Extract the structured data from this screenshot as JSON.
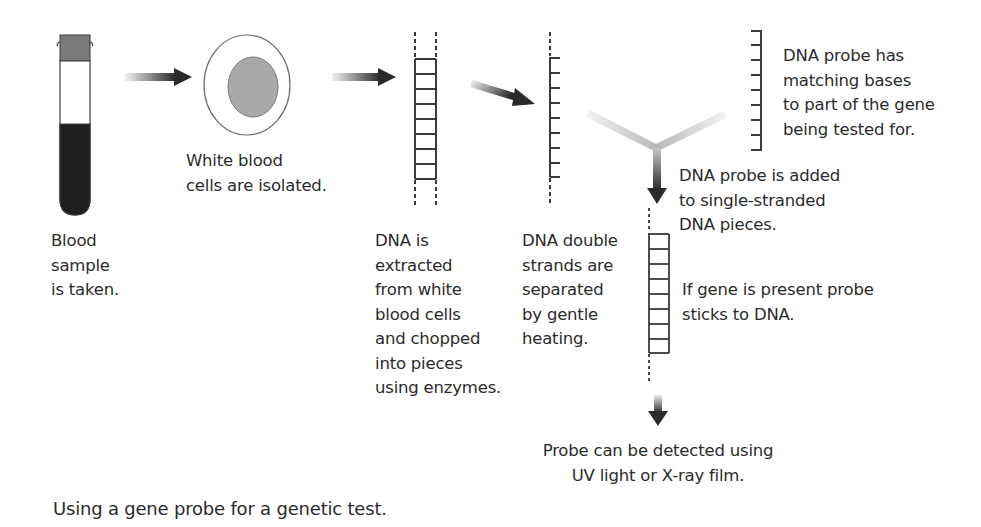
{
  "diagram": {
    "steps": [
      {
        "id": "blood-sample",
        "label": "Blood\nsample\nis taken."
      },
      {
        "id": "white-cells",
        "label": "White blood\ncells are isolated."
      },
      {
        "id": "dna-extracted",
        "label": "DNA is\nextracted\nfrom white\nblood cells\nand chopped\ninto pieces\nusing enzymes."
      },
      {
        "id": "strands-separated",
        "label": "DNA double\nstrands are\nseparated\nby gentle\nheating."
      },
      {
        "id": "probe-description",
        "label": "DNA probe has\nmatching bases\nto part of the gene\nbeing tested for."
      },
      {
        "id": "probe-added",
        "label": "DNA probe is added\nto single-stranded\nDNA pieces."
      },
      {
        "id": "probe-sticks",
        "label": "If gene is present probe\nsticks to DNA."
      },
      {
        "id": "probe-detected",
        "label": "Probe can be detected using\nUV light or X-ray film."
      }
    ],
    "caption": "Using a gene probe for a genetic test.",
    "colors": {
      "ink": "#2b2b2b",
      "tube_cap": "#7a7a7a",
      "blood": "#1e1e1e",
      "nucleus": "#a9a9a9",
      "arrow_dark": "#2a2a2a",
      "arrow_light": "#e6e6e6"
    }
  }
}
